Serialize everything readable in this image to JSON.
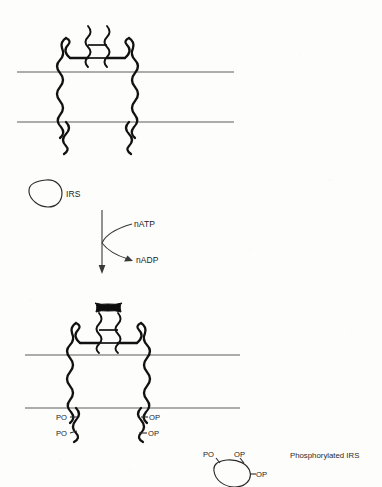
{
  "figure": {
    "background_color": "#fdfdfc",
    "ink_color": "#111111",
    "membrane_color": "#5d5d5d"
  },
  "panel_top": {
    "name": "inactive insulin receptor in membrane",
    "receptor_state": "unbound",
    "membrane": {
      "top_line_y": 72,
      "bottom_line_y": 122,
      "x_start": 17,
      "x_end": 234
    },
    "alpha_subunits": 2,
    "beta_subunits": 2,
    "disulfide_crosslinks": 2
  },
  "panel_middle": {
    "irs": {
      "label": "IRS",
      "shape": "irregular-blob",
      "phosphorylated": false
    },
    "reaction_arrow": {
      "direction": "downward",
      "substrate_label": "nATP",
      "product_label": "nADP"
    }
  },
  "panel_bottom": {
    "name": "activated insulin receptor with bound insulin",
    "receptor_state": "insulin-bound, autophosphorylated",
    "ligand": {
      "name": "insulin",
      "fill": "#0d0d0d"
    },
    "membrane": {
      "top_line_y": 355,
      "bottom_line_y": 408,
      "x_start": 25,
      "x_end": 240
    },
    "phosphate_labels_left": [
      "PO",
      "PO"
    ],
    "phosphate_labels_right": [
      "OP",
      "OP"
    ],
    "phospho_irs": {
      "labels": [
        "PO",
        "OP",
        "OP"
      ],
      "caption": "Phosphorylated IRS"
    }
  }
}
